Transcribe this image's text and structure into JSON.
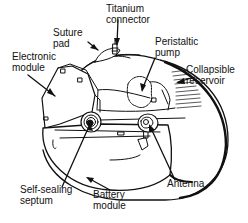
{
  "diagram": {
    "labels": {
      "suture_pad": [
        "Suture",
        "pad"
      ],
      "titanium_connector": [
        "Titanium",
        "connector"
      ],
      "electronic_module": [
        "Electronic",
        "module"
      ],
      "peristaltic_pump": [
        "Peristaltic",
        "pump"
      ],
      "collapsible_reservoir": [
        "Collapsible",
        "reservoir"
      ],
      "self_sealing_septum": [
        "Self-sealing",
        "septum"
      ],
      "battery_module": [
        "Battery",
        "module"
      ],
      "antenna": [
        "Antenna"
      ]
    },
    "colors": {
      "line": "#111111",
      "background": "#ffffff"
    }
  }
}
